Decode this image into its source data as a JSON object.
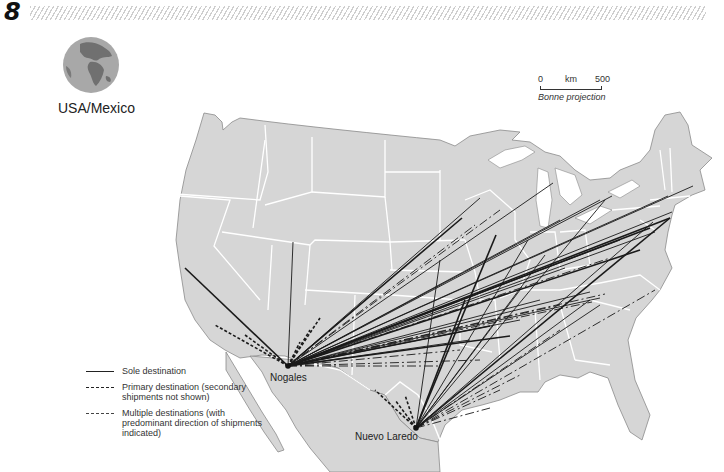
{
  "page": {
    "number": "8"
  },
  "header": {
    "region_label": "USA/Mexico",
    "globe_icon": "globe-icon"
  },
  "scale": {
    "start": "0",
    "unit": "km",
    "end": "500",
    "projection": "Bonne projection"
  },
  "legend": {
    "items": [
      {
        "style": "solid",
        "label": "Sole destination"
      },
      {
        "style": "long-dash",
        "label": "Primary destination (secondary shipments not shown)"
      },
      {
        "style": "short-dash",
        "label": "Multiple destinations (with predominant direction of shipments indicated)"
      }
    ]
  },
  "colors": {
    "land": "#d6d6d6",
    "borders": "#ffffff",
    "coast": "#8a8a8a",
    "lines": "#1a1a1a",
    "water": "#ffffff",
    "globe_land": "#707070",
    "globe_sea": "#a8a8a8"
  },
  "cities": [
    {
      "name": "Nogales",
      "x": 288,
      "y": 366,
      "label_x": 270,
      "label_y": 372
    },
    {
      "name": "Nuevo Laredo",
      "x": 416,
      "y": 428,
      "label_x": 355,
      "label_y": 431
    }
  ],
  "flows": {
    "origin_nogales": [
      288,
      366
    ],
    "origin_nuevo_laredo": [
      416,
      428
    ],
    "nogales_sole": [
      [
        185,
        268
      ],
      [
        293,
        242
      ],
      [
        370,
        296
      ],
      [
        480,
        198
      ],
      [
        462,
        218
      ],
      [
        553,
        183
      ],
      [
        668,
        196
      ],
      [
        672,
        212
      ],
      [
        670,
        218
      ],
      [
        600,
        200
      ],
      [
        560,
        220
      ],
      [
        620,
        240
      ],
      [
        640,
        250
      ],
      [
        565,
        268
      ],
      [
        590,
        292
      ],
      [
        600,
        298
      ],
      [
        490,
        326
      ],
      [
        520,
        320
      ],
      [
        470,
        340
      ],
      [
        540,
        300
      ],
      [
        510,
        336
      ],
      [
        655,
        232
      ],
      [
        693,
        186
      ],
      [
        612,
        196
      ],
      [
        650,
        228
      ]
    ],
    "nogales_primary": [
      [
        475,
        225
      ],
      [
        500,
        210
      ],
      [
        610,
        258
      ],
      [
        605,
        294
      ],
      [
        560,
        305
      ],
      [
        592,
        302
      ],
      [
        480,
        360
      ],
      [
        440,
        366
      ],
      [
        460,
        350
      ]
    ],
    "nogales_multi": [
      [
        215,
        325
      ],
      [
        245,
        335
      ],
      [
        320,
        318
      ],
      [
        310,
        330
      ],
      [
        300,
        342
      ]
    ],
    "nuevo_laredo_sole": [
      [
        496,
        235
      ],
      [
        528,
        240
      ],
      [
        545,
        255
      ],
      [
        520,
        290
      ],
      [
        670,
        218
      ],
      [
        653,
        222
      ],
      [
        605,
        200
      ],
      [
        440,
        260
      ],
      [
        465,
        300
      ],
      [
        590,
        300
      ],
      [
        600,
        305
      ]
    ],
    "nuevo_laredo_primary": [
      [
        655,
        290
      ],
      [
        560,
        330
      ],
      [
        520,
        375
      ],
      [
        500,
        390
      ],
      [
        490,
        408
      ]
    ],
    "nuevo_laredo_multi": [
      [
        375,
        390
      ],
      [
        405,
        395
      ],
      [
        395,
        400
      ]
    ]
  }
}
